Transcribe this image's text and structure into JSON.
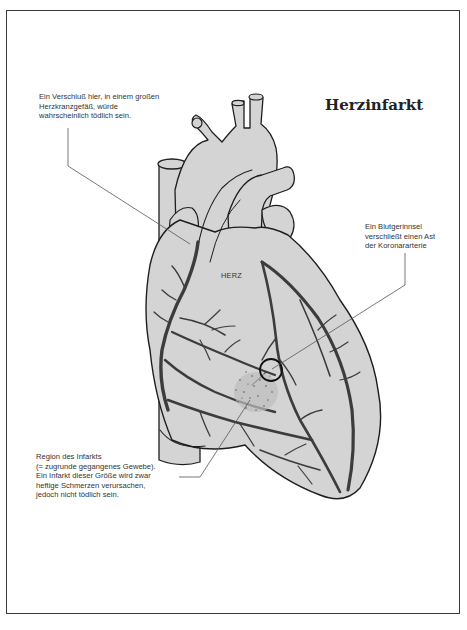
{
  "title": "Herzinfarkt",
  "heart_label": "HERZ",
  "annotations": {
    "major_vessel_occlusion": "Ein Verschluß hier, in einem großen\nHerzkranzgefäß, würde\nwahrscheinlich tödlich sein.",
    "blood_clot": "Ein Blutgerinnsel\nverschließt einen Ast\nder Koronararterie",
    "infarct_region": "Region des Infarkts\n(= zugrunde gegangenes Gewebe).\nEin Infarkt dieser Größe wird zwar\nheftige Schmerzen verursachen,\njedoch nicht tödlich sein."
  },
  "colors": {
    "heart_fill": "#d4d4d4",
    "outline": "#1e1e1e",
    "vessel": "#3c3c3c",
    "leader_line": "#555555",
    "frame": "#3a3a3a"
  }
}
